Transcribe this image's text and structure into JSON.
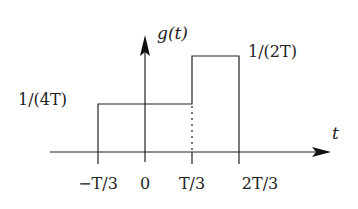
{
  "diagram": {
    "type": "piecewise-constant function plot",
    "function_label": "g(t)",
    "x_axis_label": "t",
    "x_ticks": [
      "−T/3",
      "0",
      "T/3",
      "2T/3"
    ],
    "levels": [
      {
        "label": "1/(4T)",
        "from": "−T/3",
        "to": "T/3"
      },
      {
        "label": "1/(2T)",
        "from": "T/3",
        "to": "2T/3"
      }
    ],
    "dotted_line_at": "T/3",
    "colors": {
      "line": "#222222",
      "background": "#ffffff"
    }
  },
  "labels": {
    "g": "g(t)",
    "t": "t",
    "level_low": "1/(4T)",
    "level_high": "1/(2T)",
    "tick_neg_third": "−T/3",
    "tick_zero": "0",
    "tick_third": "T/3",
    "tick_two_thirds": "2T/3"
  }
}
